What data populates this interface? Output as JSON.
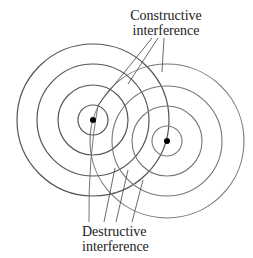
{
  "labels": {
    "constructive_line1": "Constructive",
    "constructive_line2": "interference",
    "destructive_line1": "Destructive",
    "destructive_line2": "interference"
  },
  "sources": [
    {
      "name": "source-1",
      "cx": 93,
      "cy": 120,
      "radii": [
        15,
        35,
        56,
        76
      ],
      "color": "#555555"
    },
    {
      "name": "source-2",
      "cx": 167,
      "cy": 141,
      "radii": [
        15,
        35,
        55,
        77
      ],
      "color": "#777777"
    }
  ],
  "colors": {
    "ink": "#222222",
    "dot": "#000000"
  }
}
